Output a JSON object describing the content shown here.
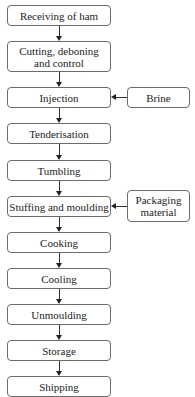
{
  "diagram": {
    "type": "process-flowchart",
    "steps": [
      {
        "id": "receiving",
        "label": "Receiving of ham"
      },
      {
        "id": "cutting",
        "label": "Cutting, deboning and control"
      },
      {
        "id": "injection",
        "label": "Injection"
      },
      {
        "id": "tenderisation",
        "label": "Tenderisation"
      },
      {
        "id": "tumbling",
        "label": "Tumbling"
      },
      {
        "id": "stuffing",
        "label": "Stuffing and moulding"
      },
      {
        "id": "cooking",
        "label": "Cooking"
      },
      {
        "id": "cooling",
        "label": "Cooling"
      },
      {
        "id": "unmoulding",
        "label": "Unmoulding"
      },
      {
        "id": "storage",
        "label": "Storage"
      },
      {
        "id": "shipping",
        "label": "Shipping"
      }
    ],
    "inputs": [
      {
        "id": "brine",
        "label": "Brine",
        "feeds": "injection"
      },
      {
        "id": "packaging",
        "label": "Packaging material",
        "feeds": "stuffing"
      }
    ],
    "colors": {
      "border": "#6b6b6b",
      "arrow": "#222222",
      "background": "#ffffff"
    }
  }
}
